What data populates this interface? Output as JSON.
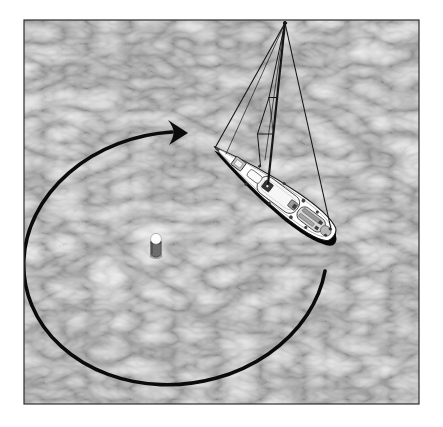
{
  "figure": {
    "alt": "Aerial illustration of a sailboat moored near a buoy, with a large clockwise elliptical arrow showing the boat's circular path around the mooring buoy",
    "objects": {
      "water": "water-surface",
      "sailboat": "sailboat-top-view",
      "buoy": "mooring-buoy",
      "arrow": "clockwise-circling-arrow"
    },
    "arrow": {
      "direction": "clockwise",
      "shape": "ellipse"
    },
    "colors": {
      "page_background": "#ffffff",
      "frame_border": "#2e2e2e",
      "water_base": "#7b7b7b",
      "water_highlight": "#b8b8b8",
      "arrow": "#0b0b0b",
      "hull": "#ffffff",
      "hull_outline": "#1c1c1c",
      "shadow": "#060606",
      "cockpit": "#d8d8d8",
      "deck_detail": "#9a9a9a",
      "rigging": "#161616",
      "buoy_cap": "#fcfcfc",
      "buoy_body": "#6d6d6d"
    }
  }
}
